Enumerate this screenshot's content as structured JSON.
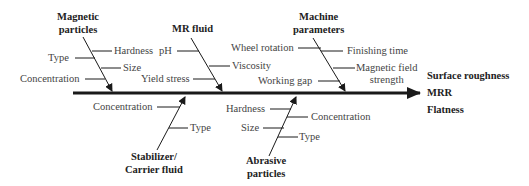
{
  "diagram": {
    "type": "fishbone",
    "effects": [
      "Surface roughness",
      "MRR",
      "Flatness"
    ],
    "categories": [
      {
        "name": "Magnetic particles",
        "lines": [
          "Magnetic",
          "particles"
        ],
        "position": "top",
        "causes": [
          "Hardness",
          "Type",
          "Size",
          "Concentration"
        ]
      },
      {
        "name": "MR fluid",
        "lines": [
          "MR fluid"
        ],
        "position": "top",
        "causes": [
          "pH",
          "Viscosity",
          "Yield stress"
        ]
      },
      {
        "name": "Machine parameters",
        "lines": [
          "Machine",
          "parameters"
        ],
        "position": "top",
        "causes": [
          "Wheel rotation",
          "Finishing time",
          "Magnetic field strength",
          "Working gap"
        ],
        "cause_lines": {
          "magnetic_field": [
            "Magnetic field",
            "strength"
          ]
        }
      },
      {
        "name": "Stabilizer/Carrier fluid",
        "lines": [
          "Stabilizer/",
          "Carrier fluid"
        ],
        "position": "bottom",
        "causes": [
          "Concentration",
          "Type"
        ]
      },
      {
        "name": "Abrasive particles",
        "lines": [
          "Abrasive",
          "particles"
        ],
        "position": "bottom",
        "causes": [
          "Hardness",
          "Concentration",
          "Size",
          "Type"
        ]
      }
    ],
    "colors": {
      "line": "#1a1a1a",
      "text": "#444444",
      "heading": "#222222"
    }
  }
}
